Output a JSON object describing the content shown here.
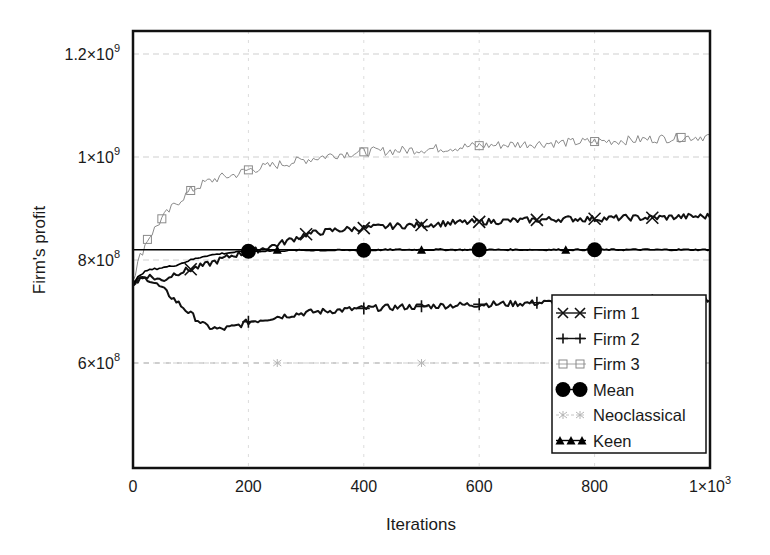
{
  "chart_data": {
    "type": "line",
    "title": "",
    "xlabel": "Iterations",
    "ylabel": "Firm's profit",
    "xlim": [
      0,
      1000
    ],
    "ylim": [
      400000000,
      1250000000
    ],
    "grid": true,
    "legend_position": "lower right (inside plot)",
    "x_ticks": [
      {
        "value": 0,
        "label": "0",
        "sup": ""
      },
      {
        "value": 200,
        "label": "200",
        "sup": ""
      },
      {
        "value": 400,
        "label": "400",
        "sup": ""
      },
      {
        "value": 600,
        "label": "600",
        "sup": ""
      },
      {
        "value": 800,
        "label": "800",
        "sup": ""
      },
      {
        "value": 1000,
        "label": "1×10",
        "sup": "3"
      }
    ],
    "y_ticks": [
      {
        "value": 600000000,
        "label": "6×10",
        "sup": "8"
      },
      {
        "value": 800000000,
        "label": "8×10",
        "sup": "8"
      },
      {
        "value": 1000000000,
        "label": "1×10",
        "sup": "9"
      },
      {
        "value": 1200000000,
        "label": "1.2×10",
        "sup": "9"
      }
    ],
    "x": [
      0,
      10,
      25,
      50,
      75,
      100,
      125,
      150,
      175,
      200,
      250,
      300,
      350,
      400,
      450,
      500,
      550,
      600,
      650,
      700,
      750,
      800,
      850,
      900,
      950,
      1000
    ],
    "series": [
      {
        "name": "Firm 1",
        "marker": "x",
        "color": "#111111",
        "values": [
          750000000,
          765000000,
          770000000,
          760000000,
          775000000,
          782000000,
          790000000,
          800000000,
          810000000,
          815000000,
          830000000,
          850000000,
          858000000,
          862000000,
          866000000,
          868000000,
          872000000,
          874000000,
          876000000,
          878000000,
          880000000,
          880000000,
          882000000,
          882000000,
          884000000,
          885000000
        ]
      },
      {
        "name": "Firm 2",
        "marker": "+",
        "color": "#111111",
        "values": [
          750000000,
          760000000,
          765000000,
          745000000,
          720000000,
          695000000,
          672000000,
          665000000,
          670000000,
          680000000,
          690000000,
          698000000,
          702000000,
          706000000,
          708000000,
          710000000,
          712000000,
          714000000,
          715000000,
          717000000,
          718000000,
          720000000,
          721000000,
          722000000,
          723000000,
          724000000
        ]
      },
      {
        "name": "Firm 3",
        "marker": "square",
        "color": "#8a8a8a",
        "values": [
          760000000,
          800000000,
          840000000,
          880000000,
          910000000,
          935000000,
          950000000,
          960000000,
          965000000,
          975000000,
          985000000,
          995000000,
          1005000000,
          1010000000,
          1012000000,
          1015000000,
          1018000000,
          1022000000,
          1024000000,
          1026000000,
          1028000000,
          1030000000,
          1032000000,
          1035000000,
          1038000000,
          1040000000
        ]
      },
      {
        "name": "Mean",
        "marker": "circle",
        "color": "#000000",
        "values": [
          750000000,
          770000000,
          780000000,
          785000000,
          790000000,
          800000000,
          808000000,
          812000000,
          815000000,
          817000000,
          818000000,
          819000000,
          819000000,
          819000000,
          820000000,
          820000000,
          820000000,
          820000000,
          820000000,
          820000000,
          820000000,
          820000000,
          820000000,
          820000000,
          820000000,
          820000000
        ]
      },
      {
        "name": "Neoclassical",
        "marker": "star",
        "color": "#b5b5b5",
        "values": [
          600000000,
          600000000,
          600000000,
          600000000,
          600000000,
          600000000,
          600000000,
          600000000,
          600000000,
          600000000,
          600000000,
          600000000,
          600000000,
          600000000,
          600000000,
          600000000,
          600000000,
          600000000,
          600000000,
          600000000,
          600000000,
          600000000,
          600000000,
          600000000,
          600000000,
          600000000
        ]
      },
      {
        "name": "Keen",
        "marker": "triangle",
        "color": "#000000",
        "values": [
          820000000,
          820000000,
          820000000,
          820000000,
          820000000,
          820000000,
          820000000,
          820000000,
          820000000,
          820000000,
          820000000,
          820000000,
          820000000,
          820000000,
          820000000,
          820000000,
          820000000,
          820000000,
          820000000,
          820000000,
          820000000,
          820000000,
          820000000,
          820000000,
          820000000,
          820000000
        ]
      }
    ],
    "marker_x": {
      "Firm 1": [
        100,
        300,
        400,
        500,
        600,
        700,
        800,
        900
      ],
      "Firm 2": [
        200,
        400,
        500,
        600,
        700,
        800,
        900
      ],
      "Firm 3": [
        25,
        50,
        100,
        200,
        400,
        600,
        800,
        950
      ],
      "Mean": [
        200,
        400,
        600,
        800
      ],
      "Neoclassical": [
        250,
        500
      ],
      "Keen": [
        250,
        500,
        750
      ]
    }
  },
  "legend": {
    "items": [
      {
        "label": "Firm 1",
        "marker": "x"
      },
      {
        "label": "Firm 2",
        "marker": "+"
      },
      {
        "label": "Firm 3",
        "marker": "square"
      },
      {
        "label": "Mean",
        "marker": "circle"
      },
      {
        "label": "Neoclassical",
        "marker": "star"
      },
      {
        "label": "Keen",
        "marker": "triangle"
      }
    ]
  },
  "axes": {
    "x_label": "Iterations",
    "y_label": "Firm's profit"
  }
}
